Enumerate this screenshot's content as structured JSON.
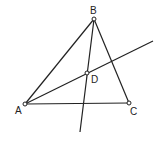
{
  "diagram": {
    "type": "geometry-triangle",
    "colors": {
      "stroke": "#222222",
      "background": "#ffffff",
      "point_fill": "#ffffff"
    },
    "points": {
      "A": {
        "label": "A",
        "x": 25,
        "y": 104,
        "label_x": 15,
        "label_y": 114
      },
      "B": {
        "label": "B",
        "x": 94,
        "y": 19,
        "label_x": 90,
        "label_y": 14
      },
      "C": {
        "label": "C",
        "x": 129,
        "y": 103,
        "label_x": 130,
        "label_y": 115
      },
      "D": {
        "label": "D",
        "x": 87,
        "y": 73,
        "label_x": 91,
        "label_y": 83
      }
    },
    "segments": [
      {
        "name": "AB",
        "from": "A",
        "to": "B"
      },
      {
        "name": "BC",
        "from": "B",
        "to": "C"
      },
      {
        "name": "AC",
        "from": "A",
        "to": "C"
      }
    ],
    "rays": [
      {
        "name": "ray-A-through-D",
        "x1": 25,
        "y1": 104,
        "x2": 153,
        "y2": 41
      },
      {
        "name": "ray-B-through-D",
        "x1": 94,
        "y1": 19,
        "x2": 80,
        "y2": 132
      }
    ]
  }
}
